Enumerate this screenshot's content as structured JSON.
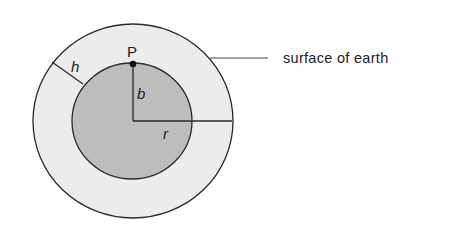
{
  "diagram": {
    "labels": {
      "point": "P",
      "depth": "b",
      "radius": "r",
      "height": "h",
      "callout": "surface of earth"
    },
    "colors": {
      "outer_fill": "#ececec",
      "inner_fill": "#bdbdbd",
      "stroke": "#2a2a2a",
      "text": "#222222"
    }
  }
}
